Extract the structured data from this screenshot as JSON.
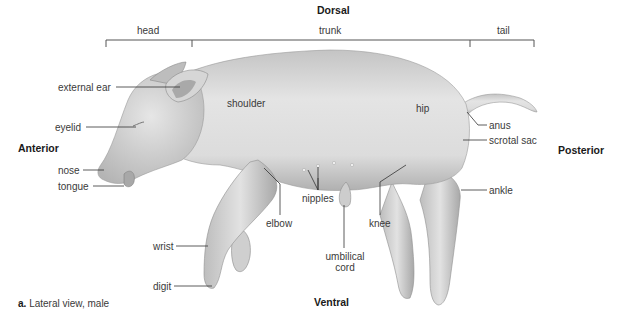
{
  "orientation": {
    "dorsal": "Dorsal",
    "ventral": "Ventral",
    "anterior": "Anterior",
    "posterior": "Posterior"
  },
  "regions": {
    "head": "head",
    "trunk": "trunk",
    "tail": "tail"
  },
  "labels": {
    "external_ear": "external ear",
    "eyelid": "eyelid",
    "nose": "nose",
    "tongue": "tongue",
    "shoulder": "shoulder",
    "hip": "hip",
    "anus": "anus",
    "scrotal_sac": "scrotal sac",
    "ankle": "ankle",
    "elbow": "elbow",
    "nipples": "nipples",
    "knee": "knee",
    "wrist": "wrist",
    "digit": "digit",
    "umbilical_cord_line1": "umbilical",
    "umbilical_cord_line2": "cord"
  },
  "caption": {
    "letter": "a.",
    "text": "Lateral view, male"
  },
  "colors": {
    "body_light": "#e6e6e6",
    "body_mid": "#c8c8c8",
    "body_dark": "#9a9a9a",
    "leader": "#333333"
  }
}
